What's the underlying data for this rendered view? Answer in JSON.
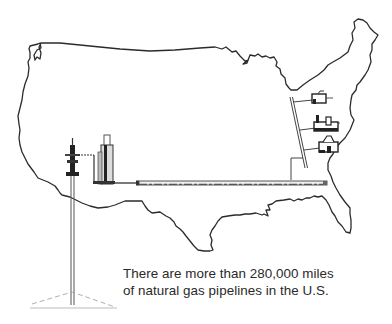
{
  "figure": {
    "caption": {
      "line1": "There are more than 280,000 miles",
      "line2": "of natural gas pipelines in the U.S."
    },
    "elements": {
      "map": "us-map-outline",
      "well": "gas-well",
      "processing_plant": "processing-plant",
      "pipeline": "transmission-pipeline",
      "distribution_line": "distribution-line",
      "buildings": [
        "house",
        "factory",
        "building"
      ]
    },
    "colors": {
      "outline": "#2b2b2b",
      "pipe": "#555555",
      "text": "#2a2a2a",
      "background": "#ffffff"
    }
  }
}
